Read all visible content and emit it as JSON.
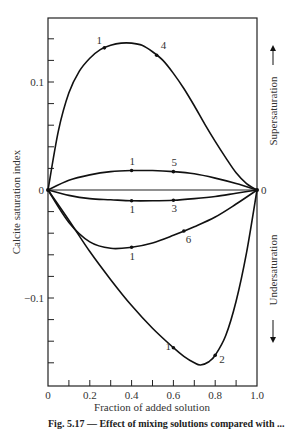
{
  "chart_data": {
    "type": "line",
    "title": "",
    "xlabel": "Fraction of added solution",
    "ylabel": "Calcite saturation index",
    "xlim": [
      0,
      1.0
    ],
    "ylim": [
      -0.17,
      0.16
    ],
    "x_ticks": [
      0,
      0.1,
      0.2,
      0.3,
      0.4,
      0.5,
      0.6,
      0.7,
      0.8,
      0.9,
      1.0
    ],
    "x_tick_labels": [
      "0",
      "0.2",
      "0.4",
      "0.6",
      "0.8",
      "1.0"
    ],
    "y_tick_labels": [
      "0.1",
      "0",
      "-0.1"
    ],
    "y_ticks": [
      0.14,
      0.12,
      0.1,
      0.08,
      0.06,
      0.04,
      0.02,
      0,
      -0.02,
      -0.04,
      -0.06,
      -0.08,
      -0.1,
      -0.12,
      -0.14,
      -0.16
    ],
    "grid": false,
    "right_annotations": {
      "upper": "Supersaturation",
      "lower": "Undersaturation",
      "right_zero_label": "0"
    },
    "series": [
      {
        "name": "1-4",
        "start_label": "1",
        "end_label": "4",
        "x": [
          0,
          0.05,
          0.1,
          0.15,
          0.2,
          0.25,
          0.3,
          0.35,
          0.4,
          0.45,
          0.5,
          0.55,
          0.6,
          0.65,
          0.7,
          0.75,
          0.8,
          0.85,
          0.9,
          0.95,
          1.0
        ],
        "values": [
          0,
          0.055,
          0.09,
          0.11,
          0.122,
          0.13,
          0.134,
          0.136,
          0.136,
          0.134,
          0.128,
          0.12,
          0.108,
          0.094,
          0.078,
          0.061,
          0.045,
          0.03,
          0.016,
          0.006,
          0
        ]
      },
      {
        "name": "1-5",
        "start_label": "1",
        "end_label": "5",
        "x": [
          0,
          0.1,
          0.2,
          0.3,
          0.4,
          0.5,
          0.6,
          0.7,
          0.8,
          0.9,
          1.0
        ],
        "values": [
          0,
          0.009,
          0.014,
          0.017,
          0.018,
          0.018,
          0.017,
          0.015,
          0.011,
          0.006,
          0
        ]
      },
      {
        "name": "1-3",
        "start_label": "1",
        "end_label": "3",
        "x": [
          0,
          0.1,
          0.2,
          0.3,
          0.4,
          0.5,
          0.6,
          0.7,
          0.8,
          0.9,
          1.0
        ],
        "values": [
          0,
          -0.005,
          -0.008,
          -0.009,
          -0.01,
          -0.01,
          -0.0095,
          -0.008,
          -0.006,
          -0.003,
          0
        ]
      },
      {
        "name": "1-6",
        "start_label": "1",
        "end_label": "6",
        "x": [
          0,
          0.1,
          0.2,
          0.3,
          0.4,
          0.5,
          0.6,
          0.7,
          0.8,
          0.9,
          1.0
        ],
        "values": [
          0,
          -0.03,
          -0.048,
          -0.054,
          -0.053,
          -0.049,
          -0.042,
          -0.034,
          -0.025,
          -0.013,
          0
        ]
      },
      {
        "name": "1-2",
        "start_label": "1",
        "end_label": "2",
        "x": [
          0,
          0.1,
          0.2,
          0.3,
          0.4,
          0.5,
          0.6,
          0.65,
          0.7,
          0.73,
          0.77,
          0.8,
          0.85,
          0.9,
          0.95,
          1.0
        ],
        "values": [
          0,
          -0.028,
          -0.057,
          -0.083,
          -0.107,
          -0.128,
          -0.146,
          -0.154,
          -0.16,
          -0.162,
          -0.159,
          -0.153,
          -0.135,
          -0.103,
          -0.058,
          0
        ]
      }
    ],
    "legend": null
  },
  "caption": "Fig. 5.17 — Effect of mixing solutions compared with ..."
}
